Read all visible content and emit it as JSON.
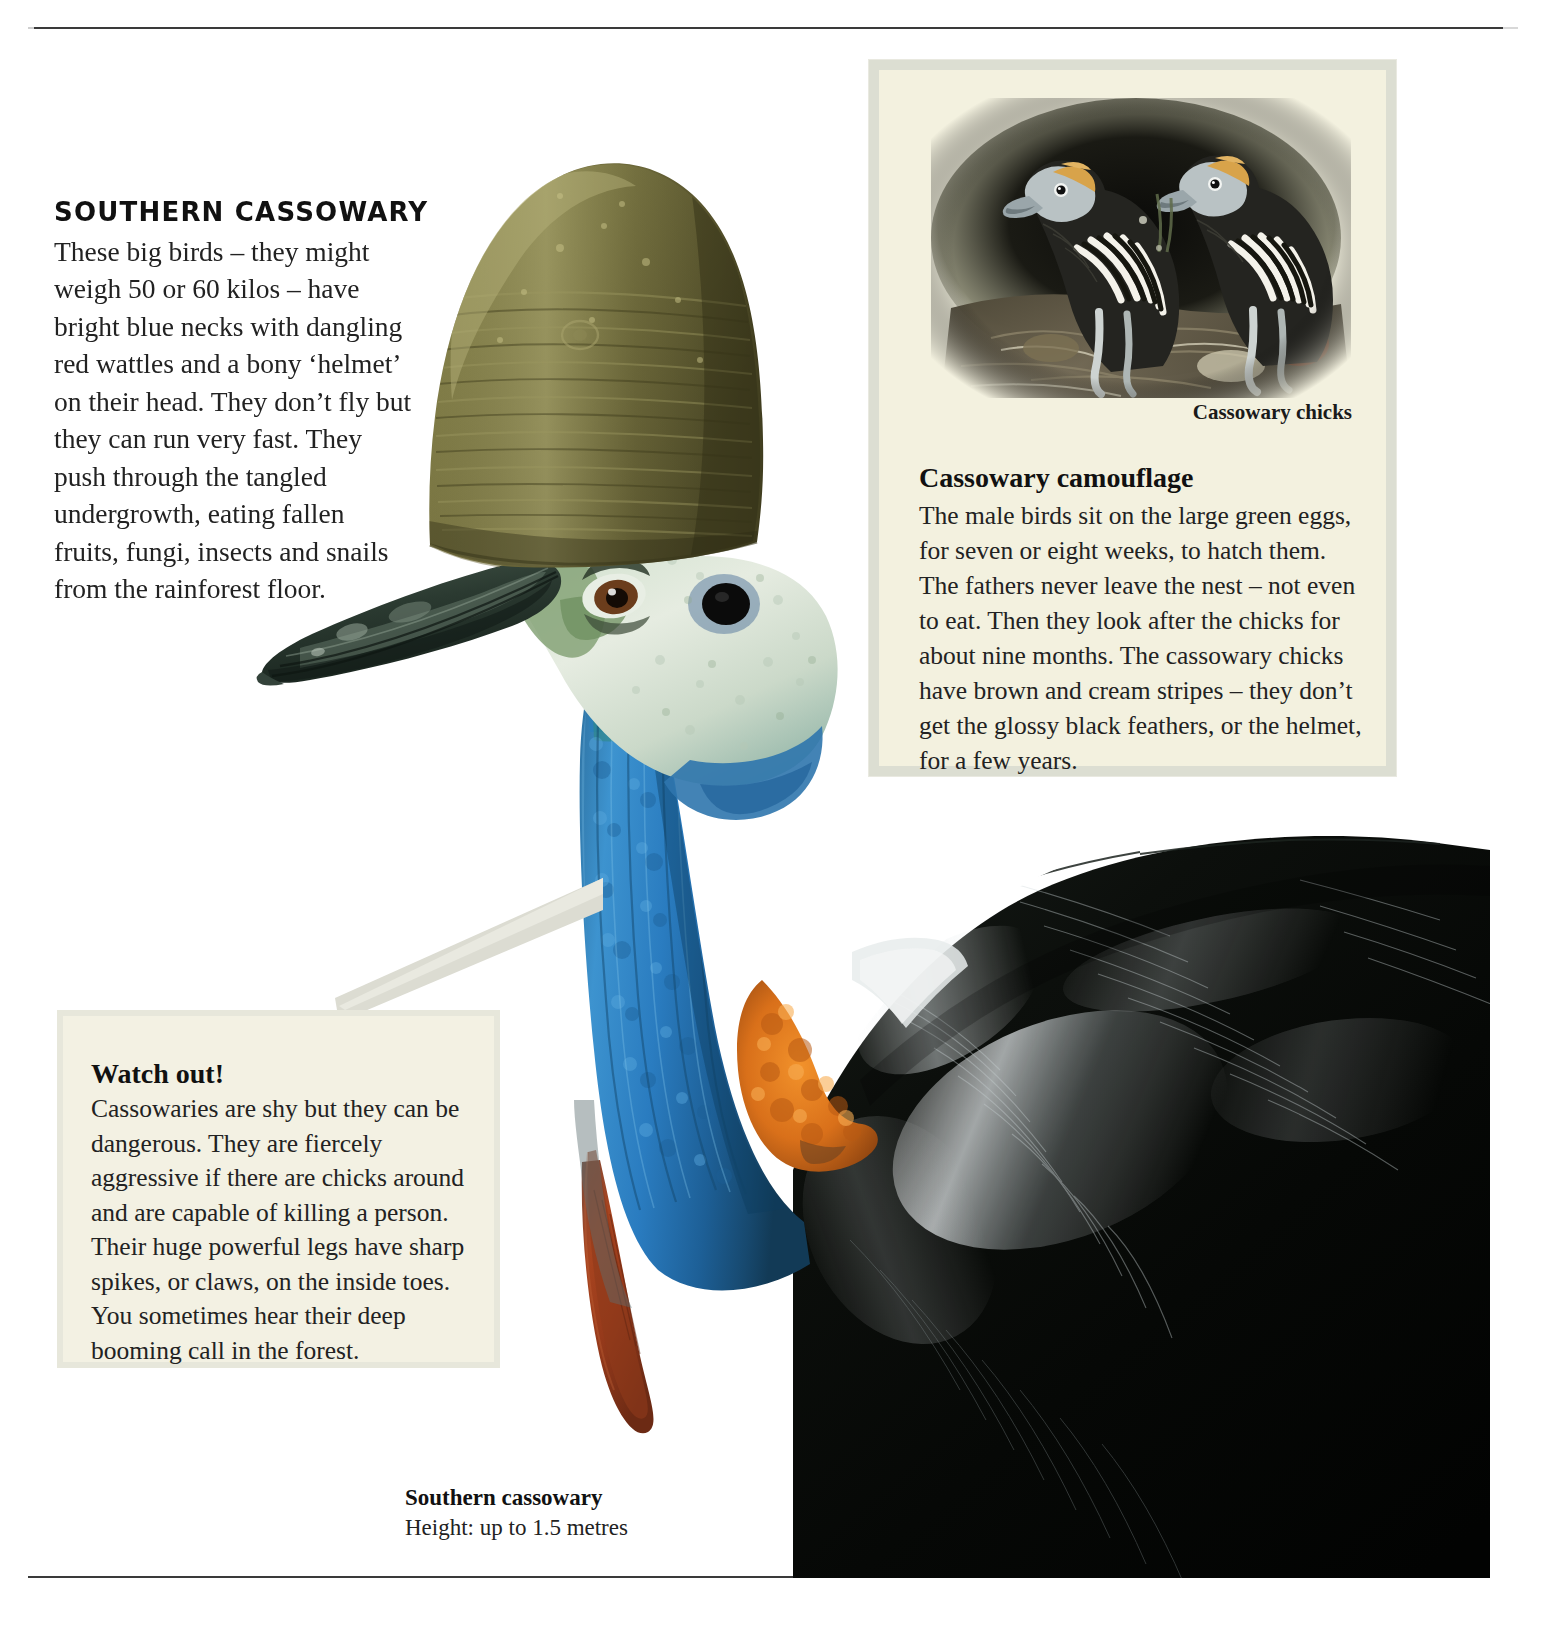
{
  "page": {
    "background_color": "#ffffff",
    "rule_color": "#3a3a3a"
  },
  "intro": {
    "heading": "SOUTHERN CASSOWARY",
    "body": "These big birds – they might weigh 50 or 60 kilos – have bright blue necks with dangling red wattles and a bony ‘helmet’ on their head. They don’t fly but they can run very fast. They push through the tangled undergrowth, eating fallen fruits, fungi, insects and snails from the rainforest floor."
  },
  "camouflage_panel": {
    "background_color": "#f3f1df",
    "border_color": "#dcded2",
    "chicks_image_label": "cassowary-chicks-photo",
    "chicks_caption": "Cassowary chicks",
    "heading": "Cassowary camouflage",
    "body": "The male birds sit on the large green eggs, for seven or eight weeks, to hatch them. The fathers never leave the nest – not even to eat. Then they look after the chicks for about nine months. The cassowary chicks have brown and cream stripes – they don’t get the glossy black feathers, or the helmet, for a few years."
  },
  "watch_out_panel": {
    "background_color": "#f3f1e3",
    "border_color": "#e7e7db",
    "heading": "Watch out!",
    "body": "Cassowaries are shy but they can be dangerous. They are fiercely aggressive if there are chicks around and are capable of killing a person. Their huge powerful legs have sharp spikes, or claws, on the inside toes. You sometimes hear their deep booming call in the forest."
  },
  "bird_caption": {
    "title": "Southern cassowary",
    "detail": "Height: up to 1.5 metres"
  },
  "bird_illustration": {
    "label": "southern-cassowary-photo",
    "helmet_color": "#6b6536",
    "beak_color": "#2c3a30",
    "face_color": "#d9e3d2",
    "neck_color": "#2a7fbf",
    "wattle_color": "#a33b1c",
    "nape_color": "#d9701a",
    "plumage_color": "#0a0a0a"
  }
}
